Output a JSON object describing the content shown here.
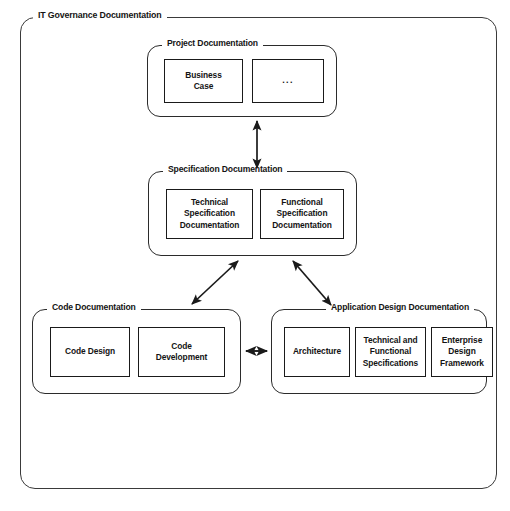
{
  "diagram": {
    "title": "IT Governance Documentation",
    "groups": [
      {
        "id": "project",
        "label": "Project Documentation",
        "nodes": [
          {
            "label": "Business\nCase",
            "line1": "Business",
            "line2": "Case"
          },
          {
            "label": "...",
            "line1": "...",
            "line2": ""
          }
        ]
      },
      {
        "id": "specification",
        "label": "Specification Documentation",
        "nodes": [
          {
            "line1": "Technical",
            "line2": "Specification",
            "line3": "Documentation"
          },
          {
            "line1": "Functional",
            "line2": "Specification",
            "line3": "Documentation"
          }
        ]
      },
      {
        "id": "code",
        "label": "Code Documentation",
        "nodes": [
          {
            "line1": "Code Design",
            "line2": "",
            "line3": ""
          },
          {
            "line1": "Code",
            "line2": "Development",
            "line3": ""
          }
        ]
      },
      {
        "id": "appdesign",
        "label": "Application Design Documentation",
        "nodes": [
          {
            "line1": "Architecture",
            "line2": "",
            "line3": ""
          },
          {
            "line1": "Technical and",
            "line2": "Functional",
            "line3": "Specifications"
          },
          {
            "line1": "Enterprise",
            "line2": "Design",
            "line3": "Framework"
          }
        ]
      }
    ],
    "connectors": [
      {
        "id": "project-specification",
        "from": "project",
        "to": "specification",
        "style": "double-headed",
        "orientation": "vertical"
      },
      {
        "id": "specification-code",
        "from": "specification",
        "to": "code",
        "style": "double-headed",
        "orientation": "diagonal-down-left"
      },
      {
        "id": "specification-appdesign",
        "from": "specification",
        "to": "appdesign",
        "style": "double-headed",
        "orientation": "diagonal-down-right"
      },
      {
        "id": "code-appdesign",
        "from": "code",
        "to": "appdesign",
        "style": "double-headed",
        "orientation": "horizontal"
      }
    ],
    "colors": {
      "stroke": "#1a1a1a",
      "frame": "#3a3a3a",
      "background": "#ffffff",
      "text": "#141414"
    }
  }
}
